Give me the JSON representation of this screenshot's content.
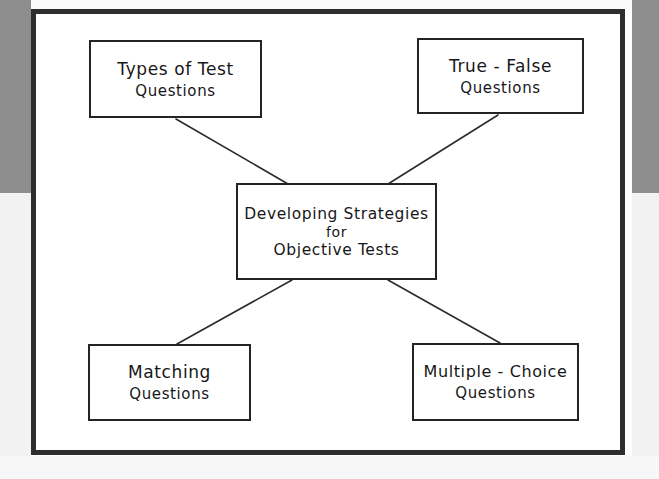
{
  "diagram": {
    "title": "Developing Strategies for Objective Tests",
    "type": "concept-map",
    "style": "hand-drawn",
    "colors": {
      "frame": "#2e2e30",
      "box_border": "#242426",
      "ink": "#17171a",
      "page": "#ffffff",
      "background_gray": "#8e8e8e"
    },
    "center_node": {
      "id": "developing-strategies",
      "line1": "Developing Strategies",
      "line2": "for",
      "line3": "Objective  Tests"
    },
    "nodes": [
      {
        "id": "types-of-test",
        "position": "top-left",
        "line1": "Types of Test",
        "line2": "Questions"
      },
      {
        "id": "true-false",
        "position": "top-right",
        "line1": "True - False",
        "line2": "Questions"
      },
      {
        "id": "matching",
        "position": "bottom-left",
        "line1": "Matching",
        "line2": "Questions"
      },
      {
        "id": "multiple-choice",
        "position": "bottom-right",
        "line1": "Multiple - Choice",
        "line2": "Questions"
      }
    ],
    "connectors": [
      {
        "id": "center-to-types-of-test",
        "from": "developing-strategies",
        "to": "types-of-test"
      },
      {
        "id": "center-to-true-false",
        "from": "developing-strategies",
        "to": "true-false"
      },
      {
        "id": "center-to-matching",
        "from": "developing-strategies",
        "to": "matching"
      },
      {
        "id": "center-to-multiple-choice",
        "from": "developing-strategies",
        "to": "multiple-choice"
      }
    ]
  }
}
